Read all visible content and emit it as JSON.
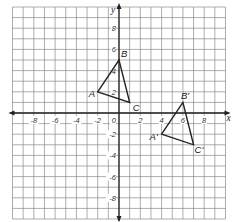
{
  "figure": {
    "type": "coordinate-grid",
    "x_axis": {
      "label": "x",
      "min": -10,
      "max": 10,
      "tick_labels": [
        "-8",
        "-6",
        "-4",
        "-2",
        "2",
        "4",
        "6",
        "8"
      ]
    },
    "y_axis": {
      "label": "y",
      "min": -10,
      "max": 10,
      "tick_labels": [
        "8",
        "6",
        "4",
        "2",
        "-2",
        "-4",
        "-6",
        "-8"
      ]
    },
    "origin_label": "0",
    "grid": {
      "step": 1,
      "line_color": "#8a8a8a",
      "axis_color": "#222222"
    },
    "triangles": [
      {
        "name": "ABC",
        "color": "#222222",
        "vertices": [
          {
            "label": "A",
            "x": -2,
            "y": 2
          },
          {
            "label": "B",
            "x": 0,
            "y": 5
          },
          {
            "label": "C",
            "x": 1,
            "y": 1
          }
        ]
      },
      {
        "name": "A'B'C'",
        "color": "#222222",
        "vertices": [
          {
            "label": "A'",
            "x": 4,
            "y": -2
          },
          {
            "label": "B'",
            "x": 6,
            "y": 1
          },
          {
            "label": "C'",
            "x": 7,
            "y": -3
          }
        ]
      }
    ]
  }
}
